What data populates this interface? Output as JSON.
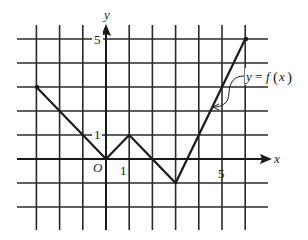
{
  "chart_data": {
    "type": "line",
    "title": "",
    "xlabel": "x",
    "ylabel": "y",
    "function_label": "y = f(x)",
    "origin_label": "O",
    "x_tick_labels": [
      {
        "value": 1,
        "label": "1"
      },
      {
        "value": 5,
        "label": "5"
      }
    ],
    "y_tick_labels": [
      {
        "value": 1,
        "label": "1"
      },
      {
        "value": 5,
        "label": "5"
      }
    ],
    "x": [
      -3,
      0,
      1,
      3,
      6
    ],
    "y": [
      3,
      0,
      1,
      -1,
      5
    ],
    "points": [
      {
        "x": -3,
        "y": 3
      },
      {
        "x": 0,
        "y": 0
      },
      {
        "x": 1,
        "y": 1
      },
      {
        "x": 3,
        "y": -1
      },
      {
        "x": 6,
        "y": 5
      }
    ],
    "xlim": [
      -4,
      7
    ],
    "ylim": [
      -3,
      6
    ],
    "grid": true,
    "grid_x": [
      -3,
      -2,
      -1,
      0,
      1,
      2,
      3,
      4,
      5,
      6
    ],
    "grid_y": [
      -2,
      -1,
      0,
      1,
      2,
      3,
      4,
      5
    ],
    "legend": null
  },
  "labels": {
    "x_axis": "x",
    "y_axis": "y",
    "origin": "O",
    "x_tick_1": "1",
    "x_tick_5": "5",
    "y_tick_1": "1",
    "y_tick_5": "5",
    "func_y": "y",
    "func_eq": "=",
    "func_f": "f",
    "func_paren_open": "(",
    "func_x": "x",
    "func_paren_close": ")"
  },
  "colors": {
    "ink": "#1a1a1a",
    "grid": "#2a2a2a",
    "background": "#ffffff"
  }
}
